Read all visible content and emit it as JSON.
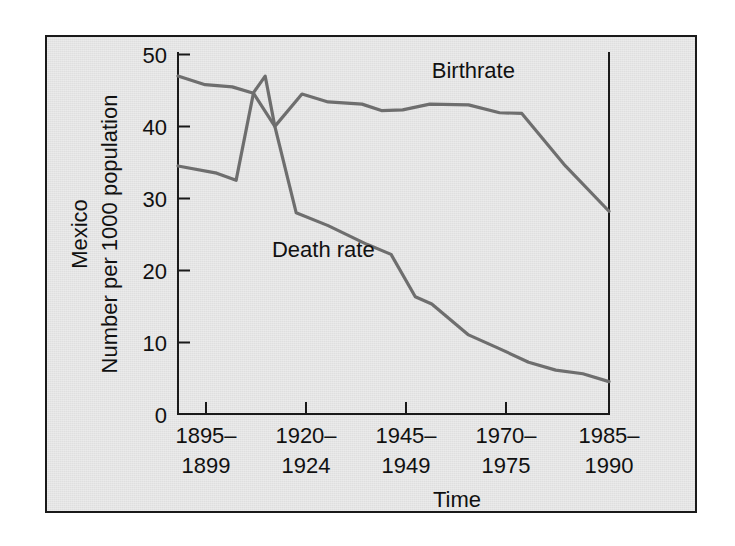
{
  "figure": {
    "background_color": "#ffffff",
    "panel_color": "#e4e4e4",
    "border_color": "#1a1a1a",
    "line_color": "#6e6e6e",
    "text_color": "#111111"
  },
  "chart_data": {
    "type": "line",
    "title": "",
    "region": "Mexico",
    "ylabel_line1": "Mexico",
    "ylabel_line2": "Number per 1000 population",
    "xlabel": "Time",
    "ylim": [
      0,
      50
    ],
    "yticks": [
      0,
      10,
      20,
      30,
      40,
      50
    ],
    "ytick_labels": [
      "0",
      "10",
      "20",
      "30",
      "40",
      "50"
    ],
    "grid": false,
    "legend_position": "inline-annotation",
    "categories": [
      "1895-1899",
      "1920-1924",
      "1945-1949",
      "1970-1975",
      "1985-1990"
    ],
    "xtick_labels": [
      {
        "top": "1895–",
        "bottom": "1899"
      },
      {
        "top": "1920–",
        "bottom": "1924"
      },
      {
        "top": "1945–",
        "bottom": "1949"
      },
      {
        "top": "1970–",
        "bottom": "1975"
      },
      {
        "top": "1985–",
        "bottom": "1990"
      }
    ],
    "series": [
      {
        "name": "Birthrate",
        "label": "Birthrate",
        "color": "#6e6e6e",
        "points": [
          {
            "x": 0.0,
            "y": 47.0
          },
          {
            "x": 0.28,
            "y": 45.8
          },
          {
            "x": 0.56,
            "y": 45.5
          },
          {
            "x": 0.78,
            "y": 44.6
          },
          {
            "x": 1.0,
            "y": 40.0
          },
          {
            "x": 1.28,
            "y": 44.5
          },
          {
            "x": 1.55,
            "y": 43.4
          },
          {
            "x": 1.9,
            "y": 43.1
          },
          {
            "x": 2.1,
            "y": 42.2
          },
          {
            "x": 2.32,
            "y": 42.3
          },
          {
            "x": 2.6,
            "y": 43.1
          },
          {
            "x": 3.0,
            "y": 43.0
          },
          {
            "x": 3.32,
            "y": 41.9
          },
          {
            "x": 3.55,
            "y": 41.8
          },
          {
            "x": 4.0,
            "y": 34.5
          },
          {
            "x": 4.45,
            "y": 28.2
          }
        ]
      },
      {
        "name": "Death rate",
        "label": "Death rate",
        "color": "#6e6e6e",
        "points": [
          {
            "x": 0.0,
            "y": 34.5
          },
          {
            "x": 0.4,
            "y": 33.5
          },
          {
            "x": 0.6,
            "y": 32.5
          },
          {
            "x": 0.78,
            "y": 44.7
          },
          {
            "x": 0.9,
            "y": 47.0
          },
          {
            "x": 1.0,
            "y": 40.0
          },
          {
            "x": 1.22,
            "y": 28.0
          },
          {
            "x": 1.55,
            "y": 26.2
          },
          {
            "x": 1.95,
            "y": 23.6
          },
          {
            "x": 2.2,
            "y": 22.2
          },
          {
            "x": 2.45,
            "y": 16.3
          },
          {
            "x": 2.62,
            "y": 15.3
          },
          {
            "x": 3.0,
            "y": 11.0
          },
          {
            "x": 3.3,
            "y": 9.2
          },
          {
            "x": 3.62,
            "y": 7.2
          },
          {
            "x": 3.9,
            "y": 6.1
          },
          {
            "x": 4.18,
            "y": 5.6
          },
          {
            "x": 4.45,
            "y": 4.5
          }
        ]
      }
    ],
    "annotations": [
      {
        "text": "Birthrate",
        "series": "Birthrate",
        "x": 3.05,
        "y": 46.7
      },
      {
        "text": "Death rate",
        "series": "Death rate",
        "x": 1.5,
        "y": 21.9
      }
    ]
  }
}
